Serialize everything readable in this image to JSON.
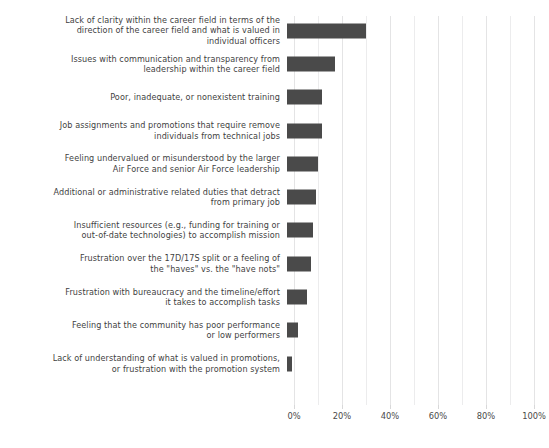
{
  "chart_data": {
    "type": "bar",
    "orientation": "horizontal",
    "title": "",
    "xlabel": "",
    "ylabel": "",
    "xlim": [
      0,
      100
    ],
    "xticks": [
      "0%",
      "20%",
      "40%",
      "60%",
      "80%",
      "100%"
    ],
    "xtick_values": [
      0,
      20,
      40,
      60,
      80,
      100
    ],
    "grid": "vertical gridlines every 10%",
    "legend": "none",
    "bar_color": "#4a4a4a",
    "categories": [
      "Lack of clarity within the career field in terms of the\ndirection of the career field and what is valued in\nindividual officers",
      "Issues with communication and transparency from\nleadership within the career field",
      "Poor, inadequate, or nonexistent training",
      "Job assignments and promotions that require remove\nindividuals from technical jobs",
      "Feeling undervalued or misunderstood by the larger\nAir Force and senior Air Force leadership",
      "Additional or administrative related duties that detract\nfrom primary job",
      "Insufficient resources (e.g., funding for training or\nout-of-date technologies) to accomplish mission",
      "Frustration over the 17D/17S split or a feeling of\nthe \"haves\" vs. the \"have nots\"",
      "Frustration with bureaucracy and the timeline/effort\nit takes to accomplish tasks",
      "Feeling that the community has poor performance\nor low performers",
      "Lack of understanding of what is valued in promotions,\nor frustration with the promotion system"
    ],
    "values": [
      33,
      20,
      14.5,
      14.5,
      13,
      12,
      11,
      10,
      8.5,
      4.5,
      2
    ]
  }
}
